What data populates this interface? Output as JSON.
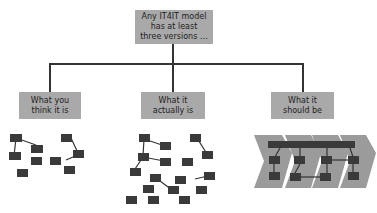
{
  "diagram": {
    "root": {
      "label": "Any IT4IT model has at least three versions …"
    },
    "children": [
      {
        "label": "What you think it is"
      },
      {
        "label": "What it actually is"
      },
      {
        "label": "What it should be"
      }
    ],
    "colors": {
      "box": "#a9a9a9",
      "node": "#3a3a3a",
      "chevron": "#9b9b9b",
      "line": "#333333"
    }
  }
}
